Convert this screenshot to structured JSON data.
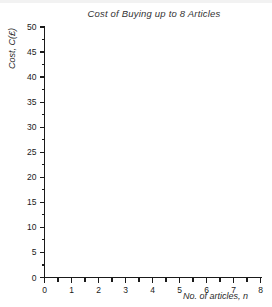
{
  "figure": {
    "background_color": "#ffffff",
    "axis_color": "#1a1a1a"
  },
  "chart_data": {
    "type": "line",
    "title": "Cost of Buying up to 8 Articles",
    "xlabel": "No. of articles, n",
    "ylabel": "Cost, C(£)",
    "xlim": [
      0,
      8
    ],
    "ylim": [
      0,
      50
    ],
    "x_major_ticks": [
      0,
      1,
      2,
      3,
      4,
      5,
      6,
      7,
      8
    ],
    "x_minor_step": 0.5,
    "y_major_ticks": [
      0,
      5,
      10,
      15,
      20,
      25,
      30,
      35,
      40,
      45,
      50
    ],
    "y_minor_step": 2.5,
    "x_tick_labels": [
      "0",
      "1",
      "2",
      "3",
      "4",
      "5",
      "6",
      "7",
      "8"
    ],
    "y_tick_labels": [
      "0",
      "5",
      "10",
      "15",
      "20",
      "25",
      "30",
      "35",
      "40",
      "45",
      "50"
    ],
    "grid": false,
    "legend": null,
    "series": [],
    "annotations": [],
    "note": "Empty plotting grid — no data points or curves drawn"
  }
}
